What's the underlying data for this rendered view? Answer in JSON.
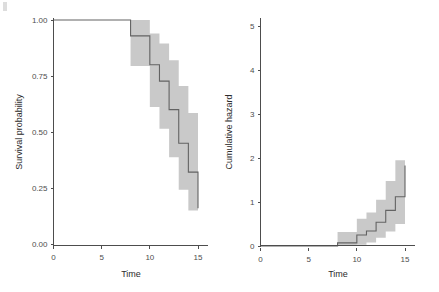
{
  "figure": {
    "background_color": "#ffffff",
    "band_color": "#c9c9c9",
    "line_color": "#636363",
    "axis_color": "#4d4d4d",
    "width": 439,
    "height": 292
  },
  "chart_data": [
    {
      "type": "line",
      "panel": "left",
      "title": "",
      "xlabel": "Time",
      "ylabel": "Survival probability",
      "xlim": [
        0,
        15.5
      ],
      "ylim": [
        0.0,
        1.02
      ],
      "xticks": [
        0,
        5,
        10,
        15
      ],
      "xtick_labels": [
        "0",
        "5",
        "10",
        "15"
      ],
      "yticks": [
        0.0,
        0.25,
        0.5,
        0.75,
        1.0
      ],
      "ytick_labels": [
        "0.00",
        "0.25",
        "0.50",
        "0.75",
        "1.00"
      ],
      "grid": false,
      "legend": "none",
      "style": "kaplan-meier step",
      "x": [
        0,
        7,
        8,
        9,
        10,
        11,
        12,
        13,
        14,
        15
      ],
      "estimate": [
        1.0,
        1.0,
        0.929,
        0.929,
        0.8,
        0.727,
        0.6,
        0.45,
        0.321,
        0.16
      ],
      "ci_lower": [
        1.0,
        1.0,
        0.795,
        0.795,
        0.612,
        0.515,
        0.387,
        0.242,
        0.149,
        0.058
      ],
      "ci_upper": [
        1.0,
        1.0,
        1.0,
        1.0,
        0.94,
        0.895,
        0.82,
        0.705,
        0.585,
        0.44
      ],
      "series": [
        {
          "name": "Survival estimate",
          "values": [
            1.0,
            1.0,
            0.929,
            0.929,
            0.8,
            0.727,
            0.6,
            0.45,
            0.321,
            0.16
          ]
        },
        {
          "name": "95% CI lower",
          "values": [
            1.0,
            1.0,
            0.795,
            0.795,
            0.612,
            0.515,
            0.387,
            0.242,
            0.149,
            0.058
          ]
        },
        {
          "name": "95% CI upper",
          "values": [
            1.0,
            1.0,
            1.0,
            1.0,
            0.94,
            0.895,
            0.82,
            0.705,
            0.585,
            0.44
          ]
        }
      ]
    },
    {
      "type": "line",
      "panel": "right",
      "title": "",
      "xlabel": "Time",
      "ylabel": "Cumulative hazard",
      "xlim": [
        0,
        15.5
      ],
      "ylim": [
        0,
        5.3
      ],
      "xticks": [
        0,
        5,
        10,
        15
      ],
      "xtick_labels": [
        "0",
        "5",
        "10",
        "15"
      ],
      "yticks": [
        0,
        1,
        2,
        3,
        4,
        5
      ],
      "ytick_labels": [
        "0",
        "1",
        "2",
        "3",
        "4",
        "5"
      ],
      "grid": false,
      "legend": "none",
      "style": "nelson-aalen step",
      "x": [
        0,
        7,
        8,
        9,
        10,
        11,
        12,
        13,
        14,
        15
      ],
      "estimate": [
        0.0,
        0.0,
        0.071,
        0.071,
        0.25,
        0.34,
        0.54,
        0.81,
        1.12,
        1.83
      ],
      "ci_lower": [
        0.0,
        0.0,
        0.0,
        0.0,
        0.03,
        0.08,
        0.19,
        0.33,
        0.5,
        0.75
      ],
      "ci_upper": [
        0.0,
        0.0,
        0.32,
        0.32,
        0.62,
        0.76,
        1.05,
        1.48,
        1.95,
        2.9
      ],
      "series": [
        {
          "name": "Cumulative hazard estimate",
          "values": [
            0.0,
            0.0,
            0.071,
            0.071,
            0.25,
            0.34,
            0.54,
            0.81,
            1.12,
            1.83
          ]
        },
        {
          "name": "95% CI lower",
          "values": [
            0.0,
            0.0,
            0.0,
            0.0,
            0.03,
            0.08,
            0.19,
            0.33,
            0.5,
            0.75
          ]
        },
        {
          "name": "95% CI upper",
          "values": [
            0.0,
            0.0,
            0.32,
            0.32,
            0.62,
            0.76,
            1.05,
            1.48,
            1.95,
            2.9
          ]
        }
      ]
    }
  ]
}
